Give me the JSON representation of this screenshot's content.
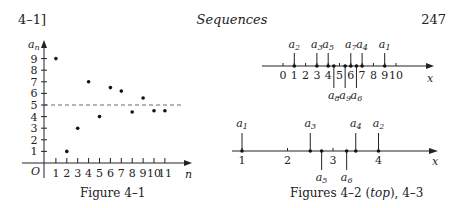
{
  "header": {
    "section": "4–1]",
    "title": "Sequences",
    "page": "247"
  },
  "fig41": {
    "caption": "Figure 4–1",
    "ylabel": "a",
    "ylabel_sub": "n",
    "xlabel": "n",
    "origin": "O",
    "yticks": [
      "1",
      "2",
      "3",
      "4",
      "5",
      "6",
      "7",
      "8",
      "9"
    ],
    "xticks": [
      "1",
      "2",
      "3",
      "4",
      "5",
      "6",
      "7",
      "8",
      "9",
      "10",
      "11"
    ],
    "dashed_line_y": 5
  },
  "fig42": {
    "xlabel": "x",
    "ticks": [
      "0",
      "1",
      "2",
      "3",
      "4",
      "5",
      "6",
      "7",
      "8",
      "9",
      "10"
    ],
    "labels_above": [
      "a2",
      "a3",
      "a5",
      "a7",
      "a4",
      "a1"
    ],
    "labels_below": [
      "a8",
      "a9",
      "a6"
    ]
  },
  "fig43": {
    "xlabel": "x",
    "ticks": [
      "1",
      "2",
      "3",
      "4"
    ],
    "labels_above": [
      "a1",
      "a3",
      "a4",
      "a2"
    ],
    "labels_below": [
      "a5",
      "a6"
    ]
  },
  "caption_right": "Figures 4–2 (top), 4–3",
  "chart_data": [
    {
      "type": "scatter",
      "title": "Figure 4–1",
      "xlabel": "n",
      "ylabel": "a_n",
      "x": [
        1,
        2,
        3,
        4,
        5,
        6,
        7,
        8,
        9,
        10,
        11
      ],
      "y": [
        9,
        1,
        3,
        7,
        4,
        6.5,
        6.2,
        4.4,
        5.6,
        4.5,
        4.5
      ],
      "reference_line": 5,
      "xlim": [
        0,
        12
      ],
      "ylim": [
        0,
        10
      ]
    },
    {
      "type": "scatter",
      "title": "Figure 4–2",
      "xlabel": "x",
      "points": [
        {
          "label": "a1",
          "x": 9
        },
        {
          "label": "a2",
          "x": 1
        },
        {
          "label": "a3",
          "x": 3
        },
        {
          "label": "a4",
          "x": 7
        },
        {
          "label": "a5",
          "x": 4
        },
        {
          "label": "a6",
          "x": 6.5
        },
        {
          "label": "a7",
          "x": 6
        },
        {
          "label": "a8",
          "x": 4.5
        },
        {
          "label": "a9",
          "x": 5.5
        }
      ],
      "xlim": [
        0,
        10
      ]
    },
    {
      "type": "scatter",
      "title": "Figure 4–3",
      "xlabel": "x",
      "points": [
        {
          "label": "a1",
          "x": 1
        },
        {
          "label": "a2",
          "x": 4
        },
        {
          "label": "a3",
          "x": 2.5
        },
        {
          "label": "a4",
          "x": 3.5
        },
        {
          "label": "a5",
          "x": 2.75
        },
        {
          "label": "a6",
          "x": 3.3
        }
      ],
      "xlim": [
        1,
        4
      ]
    }
  ]
}
